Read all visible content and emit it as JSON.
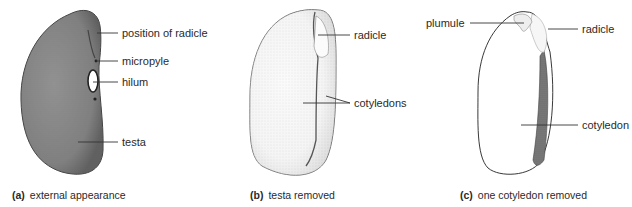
{
  "panels": [
    {
      "id": "a",
      "caption_letter": "(a)",
      "caption_text": "external appearance",
      "labels": [
        "position of radicle",
        "micropyle",
        "hilum",
        "testa"
      ]
    },
    {
      "id": "b",
      "caption_letter": "(b)",
      "caption_text": "testa removed",
      "labels": [
        "radicle",
        "cotyledons"
      ]
    },
    {
      "id": "c",
      "caption_letter": "(c)",
      "caption_text": "one cotyledon removed",
      "labels": [
        "plumule",
        "radicle",
        "cotyledon"
      ]
    }
  ],
  "colors": {
    "testa_fill": "#8a8a8a",
    "outline": "#333333",
    "leader_line": "#333333",
    "text": "#2a2a2a"
  }
}
